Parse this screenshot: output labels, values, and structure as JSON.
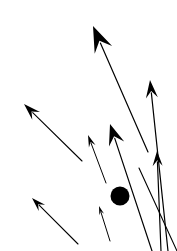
{
  "figure": {
    "width": 177,
    "height": 251,
    "background_color": "#ffffff",
    "stroke_color": "#1a1a1a",
    "fill_color": "#000000"
  },
  "chart_data": {
    "type": "scatter",
    "xlabel": "",
    "ylabel": "",
    "xlim": [
      0,
      177
    ],
    "ylim": [
      0,
      251
    ],
    "grid": false,
    "legend": null,
    "series": [
      {
        "name": "arrows",
        "marker": "arrow",
        "color": "#000000",
        "values": [
          {
            "id": "arrow-large-top-center",
            "tail_x": 148,
            "tail_y": 152,
            "tip_x": 93,
            "tip_y": 26,
            "angle_deg": 113.6,
            "length": 137.5,
            "shaft_width": 1.2,
            "head_length": 26,
            "head_width": 19
          },
          {
            "id": "arrow-medium-left",
            "tail_x": 82,
            "tail_y": 161,
            "tip_x": 24,
            "tip_y": 104,
            "angle_deg": 135.5,
            "length": 81.3,
            "shaft_width": 1.1,
            "head_length": 17,
            "head_width": 11
          },
          {
            "id": "arrow-medium-center",
            "tail_x": 152,
            "tail_y": 251,
            "tip_x": 110,
            "tip_y": 124,
            "angle_deg": 108.3,
            "length": 133.8,
            "shaft_width": 1.2,
            "head_length": 21,
            "head_width": 16
          },
          {
            "id": "arrow-small-center",
            "tail_x": 106,
            "tail_y": 183,
            "tip_x": 88,
            "tip_y": 135,
            "angle_deg": 110.6,
            "length": 51.3,
            "shaft_width": 1.0,
            "head_length": 12,
            "head_width": 7
          },
          {
            "id": "arrow-right-upper",
            "tail_x": 168,
            "tail_y": 251,
            "tip_x": 150,
            "tip_y": 80,
            "angle_deg": 96.0,
            "length": 171.9,
            "shaft_width": 1.2,
            "head_length": 18,
            "head_width": 12
          },
          {
            "id": "arrow-right-lower",
            "tail_x": 161,
            "tail_y": 251,
            "tip_x": 157,
            "tip_y": 151,
            "angle_deg": 92.3,
            "length": 100.1,
            "shaft_width": 1.2,
            "head_length": 15,
            "head_width": 10
          },
          {
            "id": "arrow-bottom-left",
            "tail_x": 78,
            "tail_y": 244,
            "tip_x": 32,
            "tip_y": 198,
            "angle_deg": 135.0,
            "length": 65.1,
            "shaft_width": 1.1,
            "head_length": 14,
            "head_width": 9
          },
          {
            "id": "arrow-tiny-bottom-center",
            "tail_x": 110,
            "tail_y": 241,
            "tip_x": 99,
            "tip_y": 206,
            "angle_deg": 107.5,
            "length": 36.7,
            "shaft_width": 1.0,
            "head_length": 9,
            "head_width": 5
          },
          {
            "id": "arrow-edge-bottom-right",
            "tail_x": 177,
            "tail_y": 251,
            "tip_x": 139,
            "tip_y": 168,
            "angle_deg": 114.6,
            "length": 91.3,
            "shaft_width": 1.1,
            "head_length": 0,
            "head_width": 0
          }
        ]
      },
      {
        "name": "dot",
        "marker": "circle",
        "color": "#000000",
        "values": [
          {
            "id": "dot-center",
            "cx": 120,
            "cy": 196,
            "r": 9.5
          }
        ]
      }
    ]
  }
}
